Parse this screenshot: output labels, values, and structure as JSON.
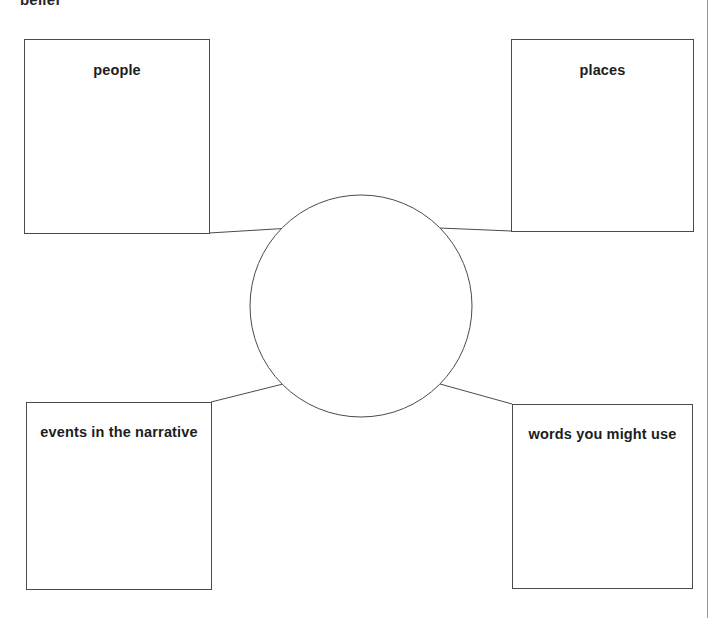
{
  "page": {
    "header_text": "belief",
    "background_color": "#ffffff",
    "line_color": "#4a4a4e",
    "margin_rule_color": "#9b9b9f",
    "width": 723,
    "height": 618
  },
  "organizer": {
    "type": "spider-map",
    "center": {
      "label": "",
      "shape": "circle",
      "cx": 361,
      "cy": 306,
      "r": 111
    },
    "nodes": [
      {
        "id": "people",
        "label": "people",
        "position": "top-left"
      },
      {
        "id": "places",
        "label": "places",
        "position": "top-right"
      },
      {
        "id": "events",
        "label": "events in the narrative",
        "position": "bottom-left"
      },
      {
        "id": "words",
        "label": "words you might use",
        "position": "bottom-right"
      }
    ],
    "connectors": [
      {
        "from": "people",
        "to": "center"
      },
      {
        "from": "places",
        "to": "center"
      },
      {
        "from": "events",
        "to": "center"
      },
      {
        "from": "words",
        "to": "center"
      }
    ]
  }
}
